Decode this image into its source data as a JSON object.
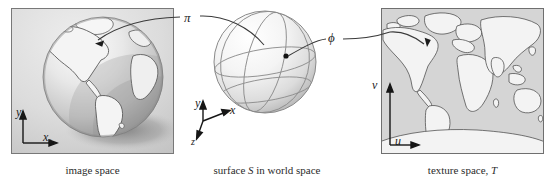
{
  "figure": {
    "domain": "diagram",
    "topic": "texture mapping pipeline",
    "background": "#ffffff"
  },
  "panels": [
    {
      "id": "image-space",
      "caption": "image space",
      "frame": {
        "x": 11,
        "y": 8,
        "w": 163,
        "h": 146,
        "border": "#7a7a7a",
        "fill": "#d9d9d9"
      },
      "content": "photograph of a textured globe lit from upper-left, casting a shadow",
      "axes": [
        {
          "name": "y_s",
          "label": "y",
          "sub": "s",
          "dir": "up"
        },
        {
          "name": "x_s",
          "label": "x",
          "sub": "s",
          "dir": "right"
        }
      ]
    },
    {
      "id": "world-space",
      "caption_parts": {
        "pre": "surface ",
        "italic": "S",
        "post": " in world space"
      },
      "caption": "surface S in world space",
      "content": "shaded sphere with longitude and latitude parametric curves and a marked surface point",
      "axes": [
        {
          "name": "y",
          "label": "y",
          "dir": "up"
        },
        {
          "name": "x",
          "label": "x",
          "dir": "right"
        },
        {
          "name": "z",
          "label": "z",
          "dir": "down"
        }
      ]
    },
    {
      "id": "texture-space",
      "caption_parts": {
        "pre": "texture space, ",
        "italic": "T",
        "post": ""
      },
      "caption": "texture space, T",
      "frame": {
        "x": 381,
        "y": 8,
        "w": 163,
        "h": 146,
        "border": "#6f6f6f",
        "fill": "#d5d5d5"
      },
      "content": "equirectangular world map outlines of the continents",
      "axes": [
        {
          "name": "v",
          "label": "v",
          "dir": "up"
        },
        {
          "name": "u",
          "label": "u",
          "dir": "right"
        }
      ]
    }
  ],
  "mappings": [
    {
      "id": "pi",
      "label": "π",
      "from": "world-space",
      "to": "image-space",
      "description": "projection from surface point to image space pixel"
    },
    {
      "id": "phi",
      "label": "ϕ",
      "from": "world-space",
      "to": "texture-space",
      "description": "surface parameterization from surface point to texture coordinates"
    }
  ],
  "colors": {
    "line": "#3a3a3a",
    "text": "#1d1d1d",
    "caption": "#2b2b2b",
    "panel_fill": "#d9d9d9",
    "panel_border": "#787878",
    "map_land": "#f2f2f2",
    "map_sea": "#d5d5d5",
    "sphere_light": "#ffffff",
    "sphere_shade": "#c3c3c3"
  }
}
